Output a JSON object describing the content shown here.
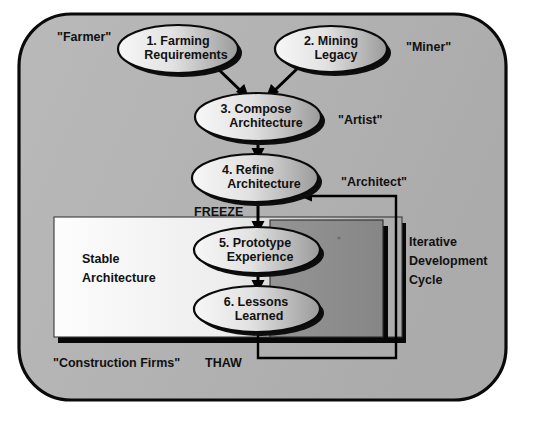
{
  "diagram": {
    "canvas": {
      "width": 542,
      "height": 427
    },
    "colors": {
      "page_background": "#ffffff",
      "panel_fill": "#b2b2b2",
      "panel_stroke": "#000000",
      "stable_box_light": "#fbfbfb",
      "stable_box_dark": "#b0b0b0",
      "inner_box_fill": "#8c8c8c",
      "shadow": "#0a0a0a",
      "ellipse_light": "#f2f2f2",
      "ellipse_dark": "#9a9a9a",
      "text": "#111111",
      "line": "#000000"
    },
    "nodes": [
      {
        "id": "n1",
        "line1": "1. Farming",
        "line2": "Requirements"
      },
      {
        "id": "n2",
        "line1": "2. Mining",
        "line2": "Legacy"
      },
      {
        "id": "n3",
        "line1": "3. Compose",
        "line2": "Architecture"
      },
      {
        "id": "n4",
        "line1": "4. Refine",
        "line2": "Architecture"
      },
      {
        "id": "n5",
        "line1": "5. Prototype",
        "line2": "Experience"
      },
      {
        "id": "n6",
        "line1": "6. Lessons",
        "line2": "Learned"
      }
    ],
    "roles": [
      {
        "id": "r_farmer",
        "label": "\"Farmer\""
      },
      {
        "id": "r_miner",
        "label": "\"Miner\""
      },
      {
        "id": "r_artist",
        "label": "\"Artist\""
      },
      {
        "id": "r_architect",
        "label": "\"Architect\""
      },
      {
        "id": "r_construction",
        "label": "\"Construction Firms\""
      }
    ],
    "edge_labels": [
      {
        "id": "e_freeze",
        "label": "FREEZE"
      },
      {
        "id": "e_thaw",
        "label": "THAW"
      }
    ],
    "boxes": [
      {
        "id": "b_stable",
        "line1": "Stable",
        "line2": "Architecture"
      }
    ],
    "side_notes": [
      {
        "id": "s_cycle",
        "line1": "Iterative",
        "line2": "Development",
        "line3": "Cycle"
      }
    ]
  }
}
